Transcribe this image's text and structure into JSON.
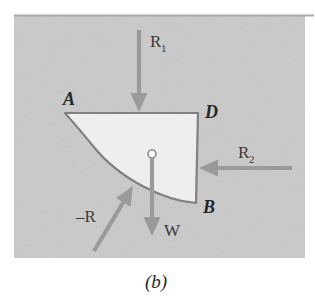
{
  "figure": {
    "caption": "(b)",
    "panel": {
      "background_color": "#cacaca",
      "top_rule_color": "#a8a8a8",
      "x": 14,
      "y": 15,
      "width": 291,
      "height": 243
    },
    "body": {
      "name": "quarter-disc-segment",
      "fill_color": "#efefef",
      "outline_color": "#7e7e7e",
      "vertices": {
        "A": {
          "x": 65,
          "y": 113
        },
        "D": {
          "x": 198,
          "y": 113
        },
        "B": {
          "x": 196,
          "y": 203
        }
      }
    },
    "vertex_labels": [
      {
        "id": "label-A",
        "text": "A",
        "x": 63,
        "y": 105
      },
      {
        "id": "label-D",
        "text": "D",
        "x": 205,
        "y": 118
      },
      {
        "id": "label-B",
        "text": "B",
        "x": 203,
        "y": 213
      }
    ],
    "centroid_marker": {
      "name": "centroid-marker",
      "x": 152,
      "y": 154,
      "radius": 4,
      "fill_color": "#ffffff",
      "stroke_color": "#8c8c8c"
    },
    "arrow_color": "#9a9a9a",
    "forces": [
      {
        "id": "force-r1",
        "label": "R",
        "subscript": "1",
        "label_x": 150,
        "label_y": 47,
        "tail": {
          "x": 139,
          "y": 30
        },
        "tip": {
          "x": 139,
          "y": 112
        },
        "direction": "down"
      },
      {
        "id": "force-r2",
        "label": "R",
        "subscript": "2",
        "label_x": 238,
        "label_y": 158,
        "tail": {
          "x": 292,
          "y": 168
        },
        "tip": {
          "x": 199,
          "y": 168
        },
        "direction": "left"
      },
      {
        "id": "force-w",
        "label": "W",
        "subscript": "",
        "label_x": 164,
        "label_y": 236,
        "tail": {
          "x": 152,
          "y": 158
        },
        "tip": {
          "x": 152,
          "y": 236
        },
        "direction": "down"
      },
      {
        "id": "force-minus-r",
        "label": "–R",
        "subscript": "",
        "label_x": 76,
        "label_y": 222,
        "tail": {
          "x": 94,
          "y": 251
        },
        "tip": {
          "x": 133,
          "y": 186
        },
        "direction": "up-right"
      }
    ]
  }
}
